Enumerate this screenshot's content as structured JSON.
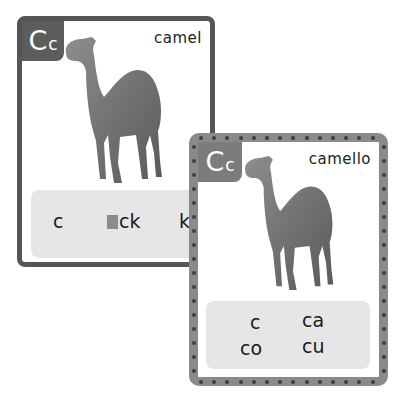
{
  "cards": [
    {
      "language": "English",
      "badge": {
        "upper": "C",
        "lower": "c"
      },
      "word": "camel",
      "image": "camel-photo",
      "spellings": [
        "c",
        "ck",
        "k"
      ],
      "highlighted_spelling_index": 1
    },
    {
      "language": "Spanish",
      "badge": {
        "upper": "C",
        "lower": "c"
      },
      "word": "camello",
      "image": "camel-photo",
      "spellings": [
        "c",
        "ca",
        "co",
        "cu"
      ]
    }
  ],
  "colors": {
    "card1_border": "#555555",
    "card2_border": "#8a8a8a",
    "badge": "#5c5c5c",
    "panel": "#e6e6e6"
  }
}
